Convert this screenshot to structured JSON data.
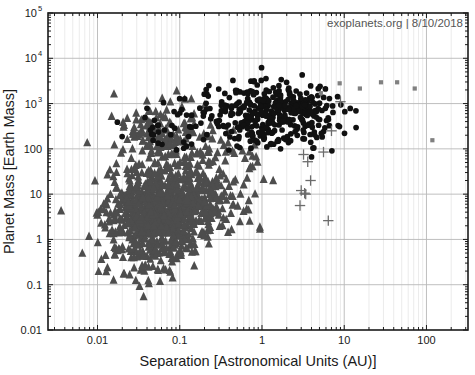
{
  "chart_data": {
    "type": "scatter",
    "title": "",
    "xlabel": "Separation [Astronomical Units (AU)]",
    "ylabel": "Planet Mass [Earth Mass]",
    "xscale": "log",
    "yscale": "log",
    "xlim": [
      0.0025,
      320
    ],
    "ylim": [
      0.01,
      100000
    ],
    "grid": true,
    "minor_grid": true,
    "legend": "none",
    "annotation": "exoplanets.org | 8/10/2018",
    "xticks": [
      "0.01",
      "0.1",
      "1",
      "10",
      "100"
    ],
    "xtick_values": [
      0.01,
      0.1,
      1,
      10,
      100
    ],
    "yticks": [
      "0.01",
      "0.1",
      "1",
      "10",
      "100",
      "10^3",
      "10^4",
      "10^5"
    ],
    "ytick_values": [
      0.01,
      0.1,
      1,
      10,
      100,
      1000,
      10000,
      100000
    ],
    "ytick_labels_plain": [
      "0.01",
      "0.1",
      "1",
      "10",
      "100"
    ],
    "ytick_labels_exp": [
      {
        "base": "10",
        "exp": "3"
      },
      {
        "base": "10",
        "exp": "4"
      },
      {
        "base": "10",
        "exp": "5"
      }
    ],
    "series": [
      {
        "name": "transit-and-small-planets",
        "marker": "triangle",
        "color": "#4d4d4d",
        "size": 4.0,
        "count": 1150,
        "description": "Dark-gray filled triangles; dominant dense cloud from 0.01-1 AU spanning 0.05-5000 Earth masses, heaviest between 0.03-0.3 AU at 2-12 Earth masses.",
        "clusters": [
          {
            "cx_log": -1.15,
            "cy_log": 0.8,
            "sx": 0.33,
            "sy": 0.42,
            "n": 520
          },
          {
            "cx_log": -1.3,
            "cy_log": 0.38,
            "sx": 0.3,
            "sy": 0.45,
            "n": 300
          },
          {
            "cx_log": -1.22,
            "cy_log": 2.3,
            "sx": 0.26,
            "sy": 0.4,
            "n": 140
          },
          {
            "cx_log": -0.62,
            "cy_log": 1.25,
            "sx": 0.32,
            "sy": 0.62,
            "n": 120
          },
          {
            "cx_log": -1.45,
            "cy_log": -0.35,
            "sx": 0.26,
            "sy": 0.38,
            "n": 70
          }
        ]
      },
      {
        "name": "radial-velocity-giants",
        "marker": "circle",
        "color": "#111111",
        "size": 4.6,
        "count": 430,
        "description": "Black filled circles; giant planets concentrated 0.5-6 AU at 100-6000 Earth masses, with a tail to 0.03 AU.",
        "clusters": [
          {
            "cx_log": 0.28,
            "cy_log": 2.82,
            "sx": 0.36,
            "sy": 0.33,
            "n": 300
          },
          {
            "cx_log": -0.22,
            "cy_log": 2.7,
            "sx": 0.34,
            "sy": 0.38,
            "n": 90
          },
          {
            "cx_log": -1.05,
            "cy_log": 2.55,
            "sx": 0.28,
            "sy": 0.36,
            "n": 40
          }
        ]
      },
      {
        "name": "microlensing-and-direct-imaging",
        "marker": "square",
        "color": "#808080",
        "size": 4.2,
        "count": 7,
        "points": [
          {
            "x": 8.8,
            "y": 2800
          },
          {
            "x": 15.5,
            "y": 2150
          },
          {
            "x": 28.0,
            "y": 2950
          },
          {
            "x": 44.0,
            "y": 2950
          },
          {
            "x": 72.0,
            "y": 2150
          },
          {
            "x": 118.0,
            "y": 155
          },
          {
            "x": 5.2,
            "y": 1700
          }
        ]
      },
      {
        "name": "timing-and-astrometry",
        "marker": "plus",
        "color": "#6b6b6b",
        "size": 6.5,
        "count": 11,
        "points": [
          {
            "x": 9.0,
            "y": 1100
          },
          {
            "x": 7.0,
            "y": 250
          },
          {
            "x": 5.6,
            "y": 85
          },
          {
            "x": 3.2,
            "y": 75
          },
          {
            "x": 3.6,
            "y": 52
          },
          {
            "x": 3.9,
            "y": 20
          },
          {
            "x": 3.0,
            "y": 12
          },
          {
            "x": 3.3,
            "y": 10.5
          },
          {
            "x": 3.4,
            "y": 10.0
          },
          {
            "x": 2.9,
            "y": 5.6
          },
          {
            "x": 6.4,
            "y": 2.6
          }
        ]
      }
    ]
  },
  "figure": {
    "credit": "exoplanets.org | 8/10/2018",
    "axis_color": "#1a1a1a",
    "grid_color": "#b8b8b8",
    "minor_grid_color": "#e2e2e2",
    "background": "#ffffff"
  }
}
